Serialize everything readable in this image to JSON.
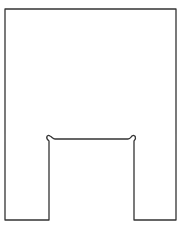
{
  "diagram": {
    "type": "outline-drawing",
    "stroke_color": "#333333",
    "background_color": "#ffffff",
    "outer": {
      "left": 5,
      "right": 176,
      "top": 9,
      "bottom": 220
    },
    "slot": {
      "left": 49,
      "right": 134,
      "top": 139,
      "relief_radius": 2.5
    }
  }
}
